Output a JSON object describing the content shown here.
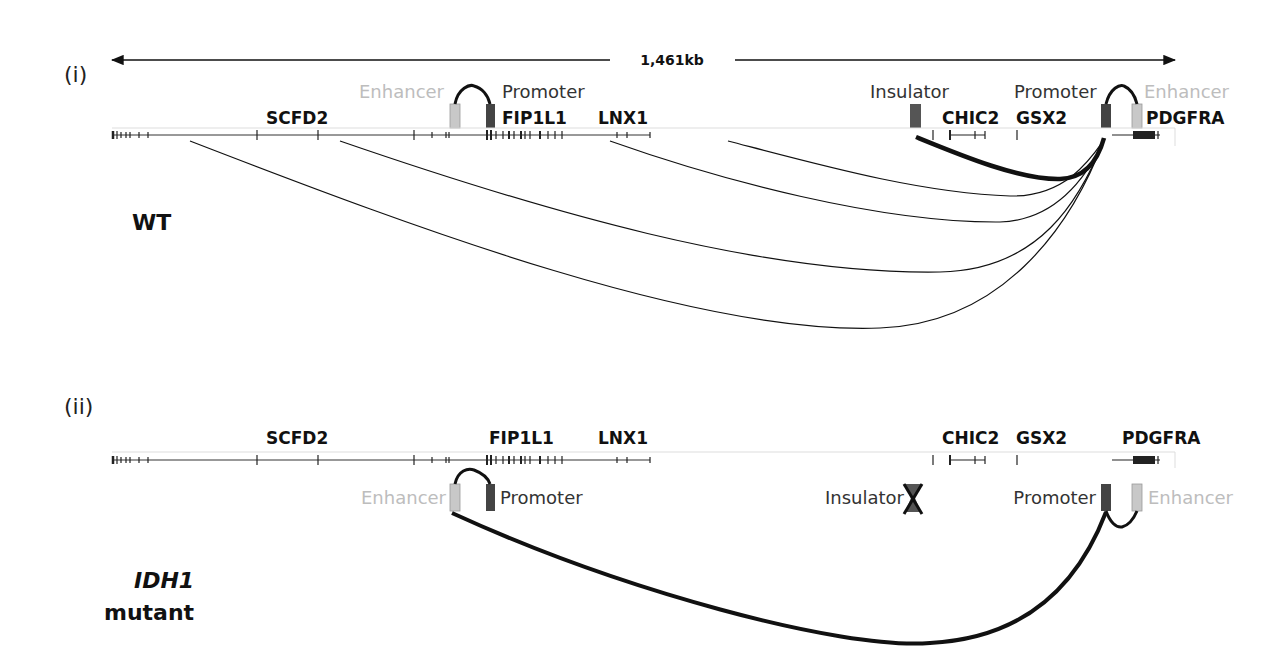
{
  "figure": {
    "scale_label": "1,461kb",
    "panels": [
      {
        "id": "i",
        "label": "(i)",
        "state_label": "WT",
        "genes": [
          "SCFD2",
          "FIP1L1",
          "LNX1",
          "CHIC2",
          "GSX2",
          "PDGFRA"
        ],
        "elements": {
          "enhancer_left": "Enhancer",
          "promoter_left": "Promoter",
          "insulator": "Insulator",
          "promoter_right": "Promoter",
          "enhancer_right": "Enhancer"
        }
      },
      {
        "id": "ii",
        "label": "(ii)",
        "state_label_italic": "IDH1",
        "state_label": "mutant",
        "genes": [
          "SCFD2",
          "FIP1L1",
          "LNX1",
          "CHIC2",
          "GSX2",
          "PDGFRA"
        ],
        "elements": {
          "enhancer_left": "Enhancer",
          "promoter_left": "Promoter",
          "insulator": "Insulator",
          "promoter_right": "Promoter",
          "enhancer_right": "Enhancer"
        }
      }
    ],
    "colors": {
      "enhancer_box": "#c8c8c8",
      "promoter_box": "#444444",
      "insulator_box": "#555555",
      "enhancer_text": "#bdbdbd",
      "dark_text": "#333333"
    }
  }
}
